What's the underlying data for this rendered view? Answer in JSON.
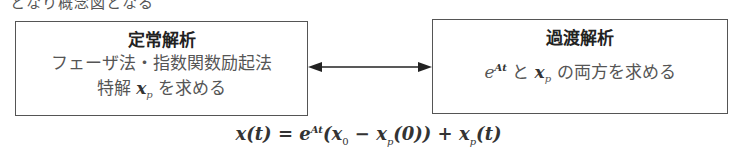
{
  "heading_partial": "となり概念図となる",
  "left_box": {
    "title": "定常解析",
    "line1": "フェーザ法・指数関数励起法",
    "line2_prefix": "特解",
    "line2_vec": "x",
    "line2_sub": "p",
    "line2_suffix": "を求める"
  },
  "right_box": {
    "title": "過渡解析",
    "exp_base": "e",
    "exp_sup": "At",
    "conj": "と",
    "vec": "x",
    "vec_sub": "p",
    "suffix": "の両方を求める"
  },
  "arrow": {
    "type": "bidirectional"
  },
  "formula": {
    "lhs": "x(t) = e",
    "exp_sup": "At",
    "mid": "(x",
    "sub0": "0",
    "minus": " − x",
    "subp": "p",
    "rest1": "(0)) + x",
    "subp2": "p",
    "rest2": "(t)"
  }
}
